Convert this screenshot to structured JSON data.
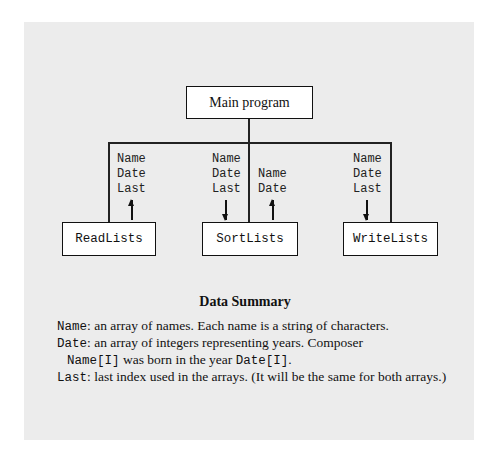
{
  "diagram": {
    "main_box": {
      "label": "Main program"
    },
    "modules": [
      {
        "label": "ReadLists",
        "params_in": [],
        "params_out": [
          "Name",
          "Date",
          "Last"
        ],
        "arrow": "up"
      },
      {
        "label": "SortLists",
        "params_in": [
          "Name",
          "Date",
          "Last"
        ],
        "params_out": [
          "Name",
          "Date"
        ],
        "arrow_in": "down",
        "arrow_out": "up"
      },
      {
        "label": "WriteLists",
        "params_in": [
          "Name",
          "Date",
          "Last"
        ],
        "params_out": [],
        "arrow": "down"
      }
    ]
  },
  "summary": {
    "title": "Data Summary",
    "entries": [
      {
        "term": "Name",
        "sep": ":",
        "text": " an array of names. Each name is a string of characters."
      },
      {
        "term": "Date",
        "sep": ":",
        "text": " an array of integers representing years. Composer"
      },
      {
        "cont_code1": "Name[I]",
        "cont_text": " was born in the year ",
        "cont_code2": "Date[I]",
        "cont_end": "."
      },
      {
        "term": "Last",
        "sep": ":",
        "text": " last index used in the arrays. (It will be the same for both arrays.)"
      }
    ]
  }
}
